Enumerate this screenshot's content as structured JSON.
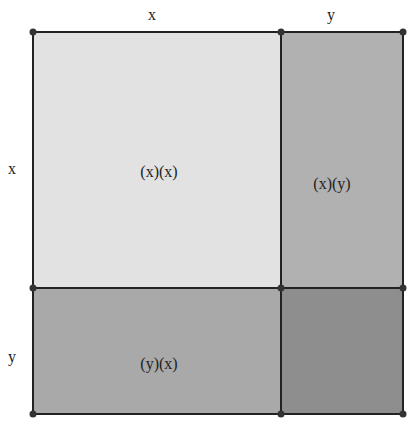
{
  "diagram": {
    "top_labels": [
      "x",
      "y"
    ],
    "side_labels": [
      "x",
      "y"
    ],
    "regions": [
      {
        "id": "xx",
        "label": "(x)(x)",
        "color": "#e2e2e2"
      },
      {
        "id": "xy",
        "label": "(x)(y)",
        "color": "#b1b1b1"
      },
      {
        "id": "yx",
        "label": "(y)(x)",
        "color": "#a9a9a9"
      },
      {
        "id": "yy",
        "label": "",
        "color": "#8e8e8e"
      }
    ]
  }
}
